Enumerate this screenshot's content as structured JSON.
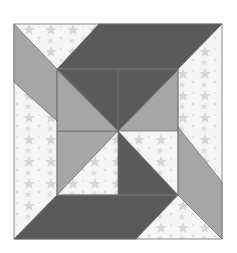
{
  "image": {
    "title": "Quilt block with pinwheel center",
    "description": "Square quilt block with star-print background, dark and medium gray parallelograms and triangles forming a pinwheel"
  },
  "colors": {
    "background_print": "#f4f4f4",
    "star": "#d9d9d9",
    "dark": "#5a5a5a",
    "medium": "#a6a6a6",
    "outline": "#7a7a7a"
  },
  "pieces": [
    {
      "name": "top-right-parallelogram",
      "fill": "dark"
    },
    {
      "name": "left-parallelogram",
      "fill": "medium"
    },
    {
      "name": "bottom-left-parallelogram",
      "fill": "dark"
    },
    {
      "name": "right-parallelogram",
      "fill": "medium"
    },
    {
      "name": "center-top-left-triangle",
      "fill": "dark"
    },
    {
      "name": "center-top-right-triangle",
      "fill": "medium"
    },
    {
      "name": "center-bottom-left-triangle",
      "fill": "medium"
    },
    {
      "name": "center-bottom-right-triangle",
      "fill": "dark"
    }
  ]
}
